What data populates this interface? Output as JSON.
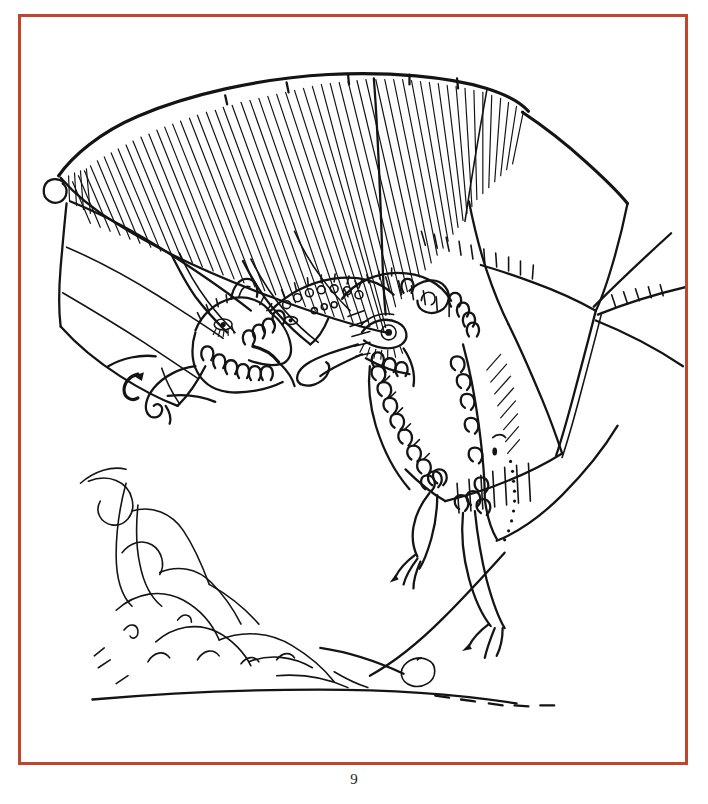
{
  "page": {
    "kind": "illustrated-book-plate",
    "background_color": "#ffffff",
    "width": 708,
    "height": 804
  },
  "frame": {
    "name": "plate-border",
    "color": "#c0462b",
    "stroke_width_px": 3,
    "left": 18,
    "top": 14,
    "width": 670,
    "height": 751
  },
  "folio": {
    "page_number": "9",
    "color": "#1d1d1d",
    "align": "center"
  },
  "artwork": {
    "title": "",
    "caption": "",
    "technique": "pen-and-ink line drawing",
    "ink_color": "#141414",
    "subject": "two-headed winged dragon in flight above a rocky landscape",
    "elements": [
      {
        "name": "left-wing-hatched",
        "description": "large upper wing filled with dense diagonal hatching"
      },
      {
        "name": "left-wing-membrane",
        "description": "lower scalloped membrane wing with spiral tip"
      },
      {
        "name": "right-wing",
        "description": "outstretched wing with ribbed tick marks and radiating spars"
      },
      {
        "name": "dragon-head-left",
        "description": "smaller head with eye, snout, ear and curled beard"
      },
      {
        "name": "dragon-head-right",
        "description": "large head with lashed eye, curled horn, scalloped mane"
      },
      {
        "name": "dragon-body",
        "description": "body with scalloped scales and stippled shading"
      },
      {
        "name": "dragon-legs",
        "description": "two dangling legs with splayed claws"
      },
      {
        "name": "dragon-tail",
        "description": "long sweeping tail curving to the right"
      },
      {
        "name": "landscape",
        "description": "loose mountain crag at left with low horizon line"
      }
    ]
  }
}
